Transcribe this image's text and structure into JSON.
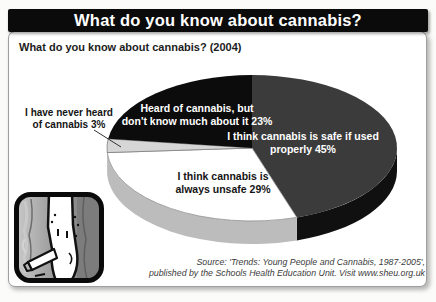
{
  "header": {
    "title": "What do you know about cannabis?"
  },
  "chart": {
    "subtitle": "What do you know about cannabis? (2004)"
  },
  "chart_data": {
    "type": "pie",
    "title": "What do you know about cannabis? (2004)",
    "style": "3d",
    "start_angle_deg": 0,
    "direction": "clockwise",
    "slices": [
      {
        "id": "safe",
        "label": "I think cannabis is safe if used properly",
        "value": 45,
        "color": "#3b3b3b",
        "side_color": "#101010",
        "text_color": "#ffffff"
      },
      {
        "id": "unsafe",
        "label": "I think cannabis is always unsafe",
        "value": 29,
        "color": "#ffffff",
        "side_color": "#bcbcbc",
        "text_color": "#141414",
        "outline": "#8f8f8f"
      },
      {
        "id": "never-heard",
        "label": "I have never heard of cannabis",
        "value": 3,
        "color": "#d6d6d6",
        "side_color": "#a5a5a5",
        "text_color": "#141414",
        "outline": "#7d7d7d"
      },
      {
        "id": "heard-of",
        "label": "Heard of cannabis, but don't know much about it",
        "value": 23,
        "color": "#0c0c0c",
        "side_color": "#000000",
        "text_color": "#ffffff"
      }
    ]
  },
  "slice_labels": {
    "heard_of": {
      "line1": "Heard of cannabis, but",
      "line2": "don't know much about it 23%"
    },
    "safe": {
      "line1": "I think cannabis is safe if used",
      "line2": "properly 45%"
    },
    "unsafe": {
      "line1": "I think cannabis is",
      "line2": "always unsafe 29%"
    },
    "never_heard": {
      "line1": "I have never heard",
      "line2": "of cannabis 3%"
    }
  },
  "source": {
    "line1": "Source: 'Trends: Young People and Cannabis, 1987-2005',",
    "line2": "published by the Schools Health Education Unit. Visit www.sheu.org.uk"
  }
}
